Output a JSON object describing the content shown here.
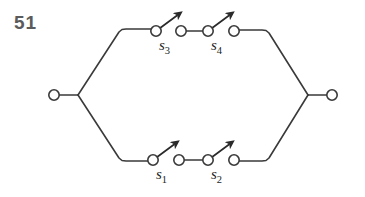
{
  "figure": {
    "number": "51",
    "caption": "",
    "type": "switching-circuit-diagram",
    "background_color": "#ffffff",
    "line_color": "#3a3a3a",
    "label_color": "#1c1c1c",
    "number_color": "#5b5b5b"
  },
  "terminals": [
    {
      "id": "left-terminal",
      "label": "",
      "cx": 54,
      "cy": 95,
      "r": 5.2
    },
    {
      "id": "right-terminal",
      "label": "",
      "cx": 332,
      "cy": 95,
      "r": 5.2
    }
  ],
  "branches": [
    {
      "id": "top-branch",
      "position": "top",
      "switches": [
        {
          "name": "s3",
          "label_base": "s",
          "label_sub": "3",
          "state": "open",
          "pivot": {
            "cx": 156,
            "cy": 31,
            "r": 5.2
          },
          "contact": {
            "cx": 181,
            "cy": 31,
            "r": 5.2
          },
          "label_x": 159,
          "label_y": 50
        },
        {
          "name": "s4",
          "label_base": "s",
          "label_sub": "4",
          "state": "open",
          "pivot": {
            "cx": 208,
            "cy": 31,
            "r": 5.2
          },
          "contact": {
            "cx": 234,
            "cy": 31,
            "r": 5.2
          },
          "label_x": 211,
          "label_y": 50
        }
      ]
    },
    {
      "id": "bottom-branch",
      "position": "bottom",
      "switches": [
        {
          "name": "s1",
          "label_base": "s",
          "label_sub": "1",
          "state": "open",
          "pivot": {
            "cx": 153,
            "cy": 160,
            "r": 5.2
          },
          "contact": {
            "cx": 179,
            "cy": 160,
            "r": 5.2
          },
          "label_x": 156,
          "label_y": 179
        },
        {
          "name": "s2",
          "label_base": "s",
          "label_sub": "2",
          "state": "open",
          "pivot": {
            "cx": 208,
            "cy": 160,
            "r": 5.2
          },
          "contact": {
            "cx": 234,
            "cy": 160,
            "r": 5.2
          },
          "label_x": 211,
          "label_y": 179
        }
      ]
    }
  ],
  "wires": {
    "left_lead": "M 59.2 95 L 78 95",
    "left_fork_up": "M 78 95 L 119 32 L 122 29.5 L 126 29 L 150.8 29",
    "left_fork_down": "M 78 95 L 119 158 L 122 160.5 L 126 161 L 147.8 161",
    "top_between": "M 186.2 31 L 202.8 31",
    "bottom_between": "M 184.2 160 L 202.8 160",
    "right_fork_up": "M 239.2 30 L 262 30 L 266 30.5 L 269 33 L 308 95",
    "right_fork_down": "M 239.2 161 L 262 161 L 266 160.5 L 269 158 L 308 95",
    "right_lead": "M 308 95 L 326.8 95"
  },
  "blades": [
    {
      "switch": "s3",
      "d": "M 159.8 28.2 L 177 15.5",
      "arrow_tip": [
        177,
        15.5
      ]
    },
    {
      "switch": "s4",
      "d": "M 211.8 28.2 L 229 15.5",
      "arrow_tip": [
        229,
        15.5
      ]
    },
    {
      "switch": "s1",
      "d": "M 156.8 157.2 L 174 144.5",
      "arrow_tip": [
        174,
        144.5
      ]
    },
    {
      "switch": "s2",
      "d": "M 211.8 157.2 L 229 144.5",
      "arrow_tip": [
        229,
        144.5
      ]
    }
  ]
}
